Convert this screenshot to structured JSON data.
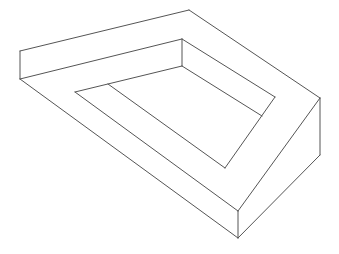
{
  "figure": {
    "title": "",
    "stroke_color": "#555555",
    "background_color": "#ffffff"
  },
  "segments": [
    {
      "name": "outer-top-back-edge",
      "x1": 20,
      "y1": 51,
      "x2": 189,
      "y2": 10
    },
    {
      "name": "outer-left-vertical",
      "x1": 20,
      "y1": 51,
      "x2": 20,
      "y2": 79
    },
    {
      "name": "top-face-front-edge",
      "x1": 20,
      "y1": 79,
      "x2": 182,
      "y2": 39
    },
    {
      "name": "outer-top-right-edge",
      "x1": 189,
      "y1": 10,
      "x2": 320,
      "y2": 98
    },
    {
      "name": "outer-right-vertical",
      "x1": 320,
      "y1": 98,
      "x2": 320,
      "y2": 155
    },
    {
      "name": "inner-top-vertical",
      "x1": 182,
      "y1": 39,
      "x2": 182,
      "y2": 66
    },
    {
      "name": "inner-top-right-edge",
      "x1": 182,
      "y1": 39,
      "x2": 275,
      "y2": 97
    },
    {
      "name": "inner-top-left-edge",
      "x1": 182,
      "y1": 66,
      "x2": 75,
      "y2": 92
    },
    {
      "name": "inner-right-face-edge",
      "x1": 182,
      "y1": 66,
      "x2": 262,
      "y2": 116
    },
    {
      "name": "inner-right-diagonal",
      "x1": 275,
      "y1": 97,
      "x2": 225,
      "y2": 168
    },
    {
      "name": "left-bottom-outer-edge",
      "x1": 20,
      "y1": 79,
      "x2": 238,
      "y2": 238
    },
    {
      "name": "left-middle-edge",
      "x1": 75,
      "y1": 92,
      "x2": 238,
      "y2": 211
    },
    {
      "name": "inner-left-edge",
      "x1": 108,
      "y1": 84,
      "x2": 225,
      "y2": 168
    },
    {
      "name": "front-vertical",
      "x1": 238,
      "y1": 211,
      "x2": 238,
      "y2": 238
    },
    {
      "name": "right-upper-front-edge",
      "x1": 320,
      "y1": 98,
      "x2": 238,
      "y2": 211
    },
    {
      "name": "right-lower-front-edge",
      "x1": 320,
      "y1": 155,
      "x2": 238,
      "y2": 238
    }
  ]
}
